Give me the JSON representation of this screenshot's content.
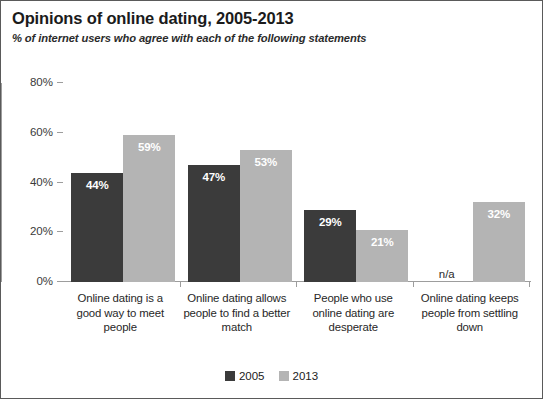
{
  "chart_data": {
    "type": "bar",
    "title": "Opinions of online dating, 2005-2013",
    "subtitle": "% of internet users who agree with each of the following statements",
    "xlabel": "",
    "ylabel": "",
    "ylim": [
      0,
      80
    ],
    "ytick_labels": [
      "0%",
      "20%",
      "40%",
      "60%",
      "80%"
    ],
    "ytick_values": [
      0,
      20,
      40,
      60,
      80
    ],
    "grid": false,
    "legend_position": "bottom",
    "categories": [
      "Online dating is a good way to meet people",
      "Online dating allows people to find a better match",
      "People who use online dating are desperate",
      "Online dating keeps people from settling down"
    ],
    "series": [
      {
        "name": "2005",
        "color": "#3b3b3b",
        "values": [
          44,
          47,
          29,
          null
        ],
        "labels": [
          "44%",
          "47%",
          "29%",
          "n/a"
        ]
      },
      {
        "name": "2013",
        "color": "#b4b4b4",
        "values": [
          59,
          53,
          21,
          32
        ],
        "labels": [
          "59%",
          "53%",
          "21%",
          "32%"
        ]
      }
    ],
    "annotations": [
      "n/a"
    ]
  }
}
